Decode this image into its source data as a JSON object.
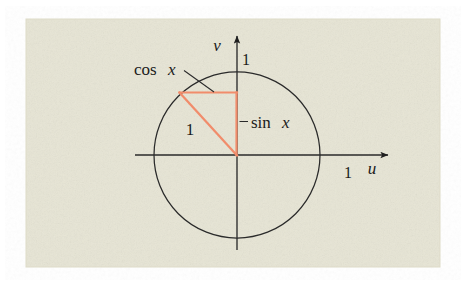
{
  "figure": {
    "panel": {
      "background_color": "#e8e6d6",
      "texture": "speckled-paper",
      "x": 26,
      "y": 19,
      "width": 414,
      "height": 248
    },
    "colors": {
      "ink": "#1f1f1f",
      "triangle": "#f18c6b",
      "page": "#ffffff",
      "panel": "#e8e6d6"
    },
    "geometry": {
      "origin": {
        "u": 0,
        "v": 0,
        "px_x": 237,
        "px_y": 155
      },
      "circle": {
        "radius_units": 1,
        "radius_px": 83
      },
      "point_on_circle": {
        "u": -0.69,
        "v": 0.75,
        "px_x": 180,
        "px_y": 93
      }
    },
    "axes": {
      "horizontal": {
        "name": "u",
        "label": "u",
        "label_style": "italic"
      },
      "vertical": {
        "name": "v",
        "label": "v",
        "label_style": "italic"
      }
    },
    "tick_labels": [
      {
        "name": "v-axis-tick-one",
        "text": "1",
        "axis": "v",
        "value": 1
      },
      {
        "name": "u-axis-tick-one",
        "text": "1",
        "axis": "u",
        "value": 1
      }
    ],
    "annotations": [
      {
        "name": "cos-label",
        "text": "cos x",
        "text_upright": "cos",
        "text_italic": "x",
        "leader": true,
        "points_to": "horizontal-leg"
      },
      {
        "name": "sin-label",
        "text": "sin x",
        "text_upright": "sin",
        "text_italic": "x",
        "leader": true,
        "points_to": "vertical-leg"
      },
      {
        "name": "radius-label",
        "text": "1",
        "leader": false,
        "points_to": "hypotenuse"
      }
    ]
  }
}
